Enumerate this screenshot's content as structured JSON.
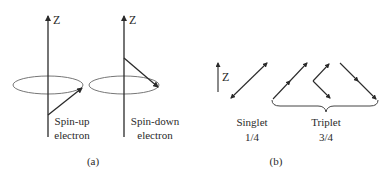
{
  "panel_a": {
    "caption": "(a)",
    "axis_label": "Z",
    "spin_up": {
      "line1": "Spin-up",
      "line2": "electron"
    },
    "spin_down": {
      "line1": "Spin-down",
      "line2": "electron"
    }
  },
  "panel_b": {
    "caption": "(b)",
    "axis_label": "Z",
    "singlet": {
      "name": "Singlet",
      "probability": "1/4"
    },
    "triplet": {
      "name": "Triplet",
      "probability": "3/4"
    }
  },
  "colors": {
    "stroke": "#2a2a2a",
    "ellipse": "#555555",
    "background": "#ffffff"
  }
}
